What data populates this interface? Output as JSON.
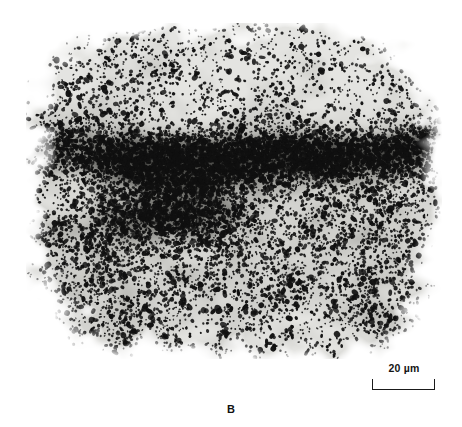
{
  "figure": {
    "panel_letter": "B",
    "type": "light-microscopy autoradiograph",
    "caption_visible": false
  },
  "micrograph": {
    "name": "autoradiograph-micrograph",
    "alt_text": "Grayscale autoradiograph of a tissue section densely covered with black silver grains",
    "frame": {
      "x": 26,
      "y": 23,
      "width": 416,
      "height": 336
    },
    "background_color": "#ffffff",
    "tone_palette": {
      "paper_white": "#ffffff",
      "tissue_light": "#e4e4e1",
      "tissue_mid_light": "#c9c9c5",
      "tissue_mid": "#aaaaa6",
      "tissue_dark": "#7b7b77",
      "tissue_very_dark": "#4e4e4b",
      "grain_black": "#101010"
    },
    "regions": [
      {
        "label": "outer pale rim",
        "tone": "#ededea",
        "grain_density": "sparse"
      },
      {
        "label": "upper light field",
        "tone": "#e4e4e1",
        "grain_density": "moderate"
      },
      {
        "label": "central dense band",
        "tone": "#5a5a57",
        "grain_density": "very dense"
      },
      {
        "label": "left diagonal dark band",
        "tone": "#6e6e6a",
        "grain_density": "dense"
      },
      {
        "label": "lower mid field",
        "tone": "#b4b4b0",
        "grain_density": "moderate-dense"
      },
      {
        "label": "right fading margin",
        "tone": "#d6d6d3",
        "grain_density": "sparse"
      }
    ]
  },
  "scale_bar": {
    "label": "20 µm",
    "value": 20,
    "unit": "µm",
    "bar_length_px": 63,
    "style": "bracket",
    "color": "#1a1a1a"
  }
}
